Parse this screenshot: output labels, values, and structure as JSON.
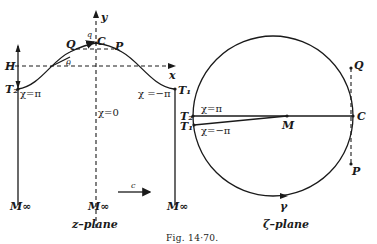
{
  "figure": {
    "caption": "Fig. 14·70."
  },
  "z_plane": {
    "caption": "z–plane",
    "labels": {
      "y_axis": "y",
      "x_axis": "x",
      "q": "q",
      "C": "C",
      "Q": "Q",
      "P": "P",
      "theta": "θ",
      "H": "H",
      "T2": "T₂",
      "T1": "T₁",
      "chi_pi": "χ=π",
      "chi_minus_pi": "χ =−π",
      "chi_zero": "χ=0",
      "M_left": "M∞",
      "M_center": "M∞",
      "M_right": "M∞",
      "c": "c"
    }
  },
  "zeta_plane": {
    "caption": "ζ–plane",
    "labels": {
      "Q": "Q",
      "C": "C",
      "T2": "T₂",
      "T1": "T₁",
      "chi_pi": "χ=π",
      "chi_minus_pi": "χ=−π",
      "M": "M",
      "P": "P",
      "gamma": "γ"
    }
  }
}
